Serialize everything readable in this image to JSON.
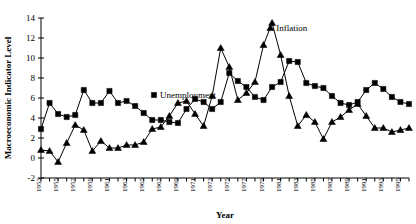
{
  "chart_data": {
    "type": "line",
    "title": "",
    "xlabel": "Year",
    "ylabel": "Macroeconomic Indicator Level",
    "xlim": [
      1953,
      1996
    ],
    "ylim": [
      -2,
      14
    ],
    "ytick_values": [
      -2,
      0,
      2,
      4,
      6,
      8,
      10,
      12,
      14
    ],
    "ytick_labels": [
      "-2",
      "0",
      "2",
      "4",
      "6",
      "8",
      "10",
      "12",
      "14"
    ],
    "xtick_labels": [
      "1953",
      "1955",
      "1957",
      "1959",
      "1961",
      "1963",
      "1965",
      "1967",
      "1969",
      "1971",
      "1973",
      "1975",
      "1977",
      "1979",
      "1981",
      "1983",
      "1985",
      "1987",
      "1989",
      "1991",
      "1993",
      "1995"
    ],
    "x": [
      1953,
      1954,
      1955,
      1956,
      1957,
      1958,
      1959,
      1960,
      1961,
      1962,
      1963,
      1964,
      1965,
      1966,
      1967,
      1968,
      1969,
      1970,
      1971,
      1972,
      1973,
      1974,
      1975,
      1976,
      1977,
      1978,
      1979,
      1980,
      1981,
      1982,
      1983,
      1984,
      1985,
      1986,
      1987,
      1988,
      1989,
      1990,
      1991,
      1992,
      1993,
      1994,
      1995,
      1996
    ],
    "grid": false,
    "legend_position": "inline-annotations",
    "series": [
      {
        "name": "Unemployment",
        "marker": "square",
        "color": "#000000",
        "label_x": 1966.2,
        "label_y": 6.3,
        "values": [
          2.9,
          5.5,
          4.4,
          4.1,
          4.3,
          6.8,
          5.5,
          5.5,
          6.7,
          5.5,
          5.7,
          5.2,
          4.5,
          3.8,
          3.8,
          3.6,
          3.5,
          4.9,
          5.9,
          5.6,
          4.9,
          5.6,
          8.5,
          7.7,
          7.1,
          6.1,
          5.8,
          7.1,
          7.6,
          9.7,
          9.6,
          7.5,
          7.2,
          7.0,
          6.2,
          5.5,
          5.3,
          5.6,
          6.8,
          7.5,
          6.9,
          6.1,
          5.6,
          5.4
        ]
      },
      {
        "name": "Inflation",
        "marker": "triangle",
        "color": "#000000",
        "label_x": 1979.8,
        "label_y": 13.0,
        "values": [
          0.8,
          0.7,
          -0.4,
          1.5,
          3.3,
          2.8,
          0.7,
          1.7,
          1.0,
          1.0,
          1.3,
          1.3,
          1.6,
          2.9,
          3.1,
          4.2,
          5.5,
          5.7,
          4.4,
          3.2,
          6.2,
          11.0,
          9.1,
          5.8,
          6.5,
          7.6,
          11.3,
          13.5,
          10.3,
          6.2,
          3.2,
          4.3,
          3.6,
          1.9,
          3.6,
          4.1,
          4.8,
          5.4,
          4.2,
          3.0,
          3.0,
          2.6,
          2.8,
          3.0
        ]
      }
    ]
  },
  "layout": {
    "plot_left": 41,
    "plot_right": 409,
    "plot_top": 18,
    "plot_bottom": 178
  }
}
